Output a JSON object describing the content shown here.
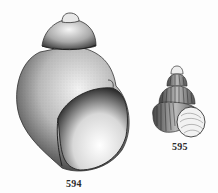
{
  "plate": {
    "background": "#fdfdfd",
    "ink_color": "#2a2a2a",
    "figures": [
      {
        "number": "594",
        "subject": "large-smooth-gastropod-shell",
        "description": "Smooth, globose spiral shell with rounded whorls and large oval aperture, stipple-shaded"
      },
      {
        "number": "595",
        "subject": "small-ribbed-gastropod-shell",
        "description": "Small turbinate shell with strong axial ribs on each whorl and round aperture"
      }
    ]
  }
}
